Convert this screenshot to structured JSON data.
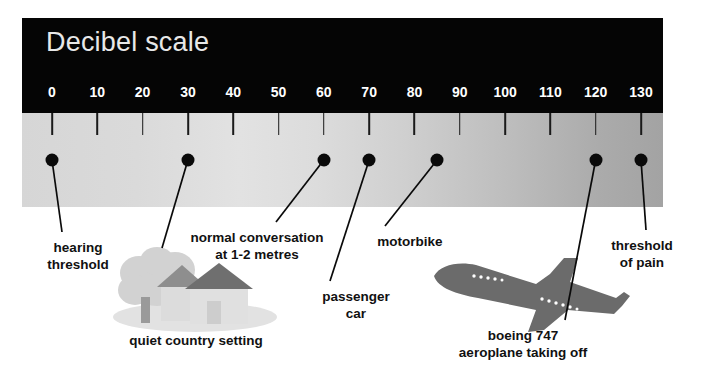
{
  "title": "Decibel scale",
  "chart_data": {
    "type": "scatter",
    "title": "Decibel scale",
    "xlabel": "",
    "ylabel": "",
    "xlim": [
      0,
      130
    ],
    "tick_step": 10,
    "tick_labels": [
      "0",
      "10",
      "20",
      "30",
      "40",
      "50",
      "60",
      "70",
      "80",
      "90",
      "100",
      "110",
      "120",
      "130"
    ],
    "tick_values": [
      0,
      10,
      20,
      30,
      40,
      50,
      60,
      70,
      80,
      90,
      100,
      110,
      120,
      130
    ],
    "grid": false,
    "legend": "none",
    "unit": "dB",
    "points": [
      {
        "value": 0,
        "label": "hearing\nthreshold"
      },
      {
        "value": 30,
        "label": "quiet country setting"
      },
      {
        "value": 60,
        "label": "normal conversation\nat 1-2 metres"
      },
      {
        "value": 70,
        "label": "passenger\ncar"
      },
      {
        "value": 85,
        "label": "motorbike"
      },
      {
        "value": 120,
        "label": "boeing 747\naeroplane taking off"
      },
      {
        "value": 130,
        "label": "threshold\nof pain"
      }
    ]
  },
  "labels": {
    "hearing_threshold": "hearing\nthreshold",
    "quiet_country": "quiet country setting",
    "normal_conversation": "normal conversation\nat 1-2 metres",
    "passenger_car": "passenger\ncar",
    "motorbike": "motorbike",
    "boeing": "boeing 747\naeroplane taking off",
    "threshold_pain": "threshold\nof pain"
  },
  "illustrations": {
    "country_scene": "tree-and-house-illustration",
    "aeroplane": "boeing-747-illustration"
  },
  "colors": {
    "header_band": "#050505",
    "title_text": "#e8e8e8",
    "tick_text": "#ffffff",
    "dot": "#0a0a0a",
    "label_text": "#111111",
    "gradient_start": "#d6d6d6",
    "gradient_end": "#a3a3a3",
    "illustration_light": "#cfcfcf",
    "illustration_dark": "#6b6b6b"
  }
}
